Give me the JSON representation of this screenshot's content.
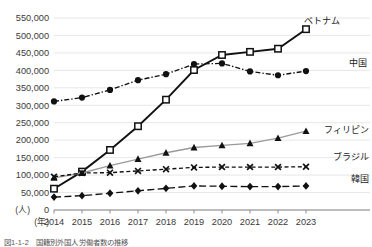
{
  "chart_data": {
    "type": "line",
    "title": "",
    "xlabel": "(年)",
    "ylabel": "",
    "unit_label": "(人)",
    "grid": true,
    "legend_position": "inline-right",
    "categories": [
      "2014",
      "2015",
      "2016",
      "2017",
      "2018",
      "2019",
      "2020",
      "2021",
      "2022",
      "2023"
    ],
    "ylim": [
      0,
      550000
    ],
    "yticks": [
      0,
      50000,
      100000,
      150000,
      200000,
      250000,
      300000,
      350000,
      400000,
      450000,
      500000,
      550000
    ],
    "ytick_labels": [
      "0",
      "50,000",
      "100,000",
      "150,000",
      "200,000",
      "250,000",
      "300,000",
      "350,000",
      "400,000",
      "450,000",
      "500,000",
      "550,000"
    ],
    "series": [
      {
        "name": "ベトナム",
        "label": "ベトナム",
        "marker": "open-square",
        "line_style": "solid",
        "color": "#111111",
        "values": [
          61000,
          110000,
          172000,
          240000,
          316000,
          401000,
          444000,
          453000,
          462000,
          518000
        ]
      },
      {
        "name": "中国",
        "label": "中国",
        "marker": "filled-circle",
        "line_style": "dash-dot",
        "color": "#111111",
        "values": [
          311000,
          322000,
          344000,
          372000,
          389000,
          418000,
          420000,
          397000,
          386000,
          398000
        ]
      },
      {
        "name": "フィリピン",
        "label": "フィリピン",
        "marker": "filled-triangle",
        "line_style": "solid",
        "color": "#9a9a9a",
        "values": [
          92000,
          106000,
          127000,
          146000,
          164000,
          179000,
          185000,
          191000,
          206000,
          226000
        ]
      },
      {
        "name": "ブラジル",
        "label": "ブラジル",
        "marker": "x-cross",
        "line_style": "dashed",
        "color": "#111111",
        "values": [
          95000,
          106000,
          107000,
          112000,
          117000,
          122000,
          123000,
          123000,
          123000,
          124000
        ]
      },
      {
        "name": "韓国",
        "label": "韓国",
        "marker": "filled-diamond",
        "line_style": "long-dash",
        "color": "#111111",
        "values": [
          37000,
          41000,
          48000,
          55000,
          62000,
          69000,
          68000,
          67000,
          67000,
          69000
        ]
      }
    ]
  },
  "caption": {
    "text": "図1‑1‑2　国籍別外国人労働者数の推移"
  }
}
